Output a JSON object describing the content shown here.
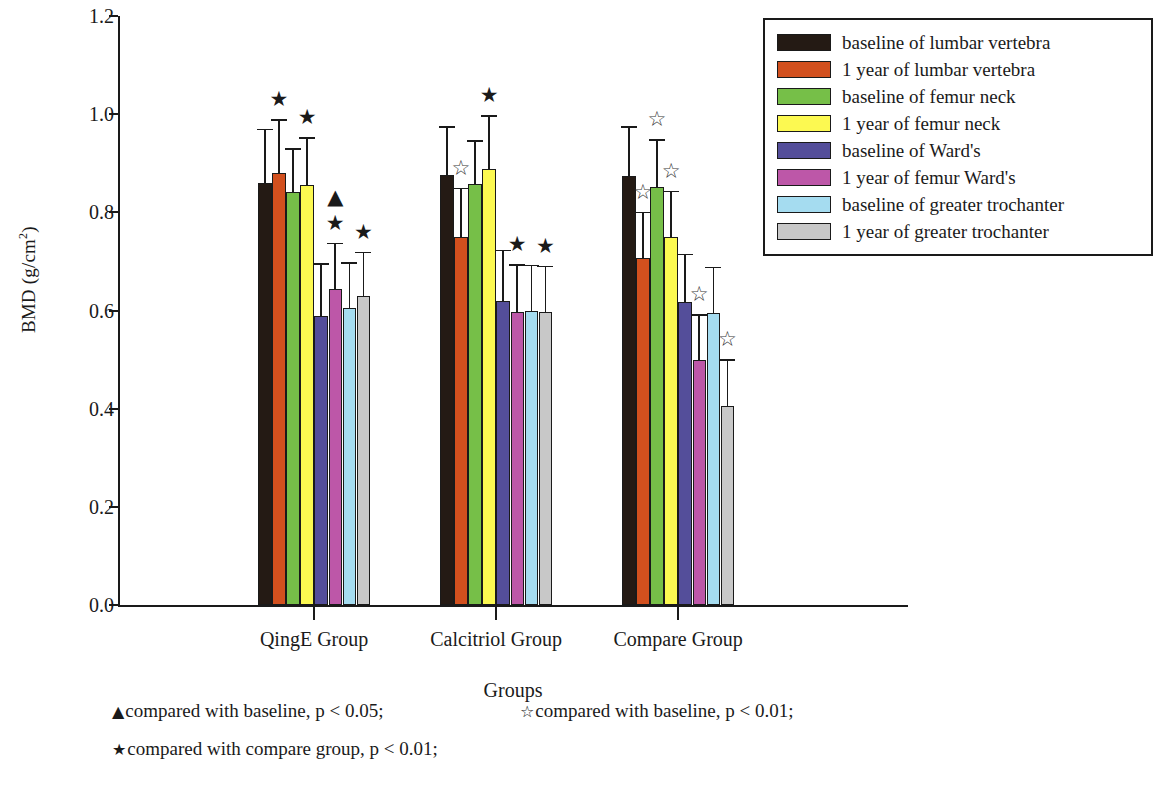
{
  "chart_data": {
    "type": "bar",
    "title": "",
    "xlabel": "Groups",
    "ylabel": "BMD (g/cm2)",
    "ylabel_html": "BMD (g/cm²)",
    "ylim": [
      0.0,
      1.2
    ],
    "ytick_labels": [
      "0.0",
      "0.2",
      "0.4",
      "0.6",
      "0.8",
      "1.0",
      "1.2"
    ],
    "ytick_values": [
      0.0,
      0.2,
      0.4,
      0.6,
      0.8,
      1.0,
      1.2
    ],
    "grid": false,
    "legend_position": "top-right",
    "categories": [
      "QingE Group",
      "Calcitriol Group",
      "Compare Group"
    ],
    "series": [
      {
        "name": "baseline of lumbar vertebra",
        "color": "#241a14",
        "values": [
          0.86,
          0.877,
          0.874
        ],
        "errors": [
          0.11,
          0.098,
          0.101
        ],
        "markers": [
          "",
          "",
          ""
        ]
      },
      {
        "name": "1 year of lumbar vertebra",
        "color": "#d2501e",
        "values": [
          0.88,
          0.75,
          0.706
        ],
        "errors": [
          0.11,
          0.1,
          0.095
        ],
        "markers": [
          "filled-star",
          "open-star",
          "open-star"
        ]
      },
      {
        "name": "baseline of femur neck",
        "color": "#76bf48",
        "values": [
          0.841,
          0.857,
          0.851
        ],
        "errors": [
          0.09,
          0.09,
          0.098
        ],
        "markers": [
          "",
          "",
          "open-star"
        ]
      },
      {
        "name": "1 year of femur neck",
        "color": "#fcf951",
        "values": [
          0.855,
          0.888,
          0.749
        ],
        "errors": [
          0.098,
          0.11,
          0.095
        ],
        "markers": [
          "filled-star",
          "filled-star",
          "open-star"
        ]
      },
      {
        "name": "baseline of Ward's",
        "color": "#544e9a",
        "values": [
          0.588,
          0.619,
          0.617
        ],
        "errors": [
          0.108,
          0.105,
          0.099
        ],
        "markers": [
          "",
          "",
          ""
        ]
      },
      {
        "name": "1 year of femur Ward's",
        "color": "#bd57a8",
        "values": [
          0.643,
          0.596,
          0.5
        ],
        "errors": [
          0.095,
          0.098,
          0.092
        ],
        "markers": [
          "filled-star-and-triangle",
          "filled-star",
          "open-star"
        ]
      },
      {
        "name": "baseline of greater trochanter",
        "color": "#a5dcf0",
        "values": [
          0.606,
          0.598,
          0.594
        ],
        "errors": [
          0.092,
          0.095,
          0.095
        ],
        "markers": [
          "",
          "",
          ""
        ]
      },
      {
        "name": "1 year of greater trochanter",
        "color": "#c8c8c8",
        "values": [
          0.63,
          0.596,
          0.406
        ],
        "errors": [
          0.09,
          0.095,
          0.095
        ],
        "markers": [
          "filled-star",
          "filled-star",
          "open-star"
        ]
      }
    ],
    "markers_legend": [
      {
        "symbol": "filled-triangle",
        "glyph": "▲",
        "text": "compared with baseline, p < 0.05;"
      },
      {
        "symbol": "open-star",
        "glyph": "☆",
        "text": "compared with baseline, p < 0.01;"
      },
      {
        "symbol": "filled-star",
        "glyph": "★",
        "text": "compared with compare group, p < 0.01;"
      }
    ]
  },
  "legend": {
    "items": [
      {
        "label": "baseline of lumbar vertebra",
        "color": "#241a14"
      },
      {
        "label": "1 year of lumbar vertebra",
        "color": "#d2501e"
      },
      {
        "label": "baseline of femur neck",
        "color": "#76bf48"
      },
      {
        "label": "1 year of femur neck",
        "color": "#fcf951"
      },
      {
        "label": "baseline of Ward's",
        "color": "#544e9a"
      },
      {
        "label": "1 year of femur Ward's",
        "color": "#bd57a8"
      },
      {
        "label": "baseline of greater trochanter",
        "color": "#a5dcf0"
      },
      {
        "label": "1 year of greater trochanter",
        "color": "#c8c8c8"
      }
    ]
  },
  "axes": {
    "y_title": "BMD (g/cm",
    "y_title_sup": "2",
    "y_title_close": ")",
    "x_title": "Groups",
    "ytick_labels": [
      "1.2",
      "1.0",
      "0.8",
      "0.6",
      "0.4",
      "0.2",
      "0.0"
    ],
    "xtick_labels": [
      "QingE Group",
      "Calcitriol Group",
      "Compare Group"
    ]
  },
  "footnotes": {
    "line1_left_glyph": "▲",
    "line1_left_text": "compared with baseline, p < 0.05;",
    "line1_right_glyph": "☆",
    "line1_right_text": "compared with baseline, p < 0.01;",
    "line2_glyph": "★",
    "line2_text": "compared with compare group, p < 0.01;"
  }
}
